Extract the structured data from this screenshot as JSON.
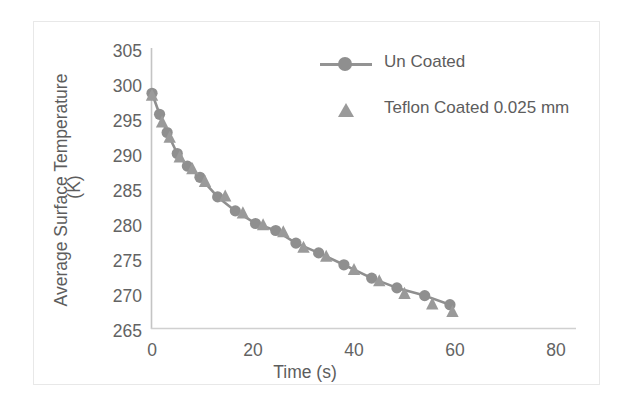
{
  "chart_data": {
    "type": "line",
    "title": "",
    "xlabel": "Time (s)",
    "ylabel": "Average Surface Temperature (K)",
    "ylabel_line1": "Average Surface Temperature",
    "ylabel_line2": "(K)",
    "xlim": [
      0,
      80
    ],
    "ylim": [
      265,
      305
    ],
    "xticks": [
      0,
      20,
      40,
      60,
      80
    ],
    "yticks": [
      265,
      270,
      275,
      280,
      285,
      290,
      295,
      300,
      305
    ],
    "grid": false,
    "legend_position": "top-right",
    "series_color": "#8f8f8f",
    "axis_color": "#c9c9c9",
    "text_color": "#5d5d5d",
    "series": [
      {
        "name": "Un Coated",
        "marker": "circle",
        "line": true,
        "x": [
          0,
          1.5,
          3,
          5,
          7,
          9.5,
          13,
          16.5,
          20.5,
          24.5,
          28.5,
          33,
          38,
          43.5,
          48.5,
          54,
          59
        ],
        "y": [
          298.6,
          295.6,
          293.0,
          290.0,
          288.2,
          286.6,
          283.8,
          281.8,
          280.0,
          279.0,
          277.2,
          275.8,
          274.1,
          272.2,
          270.8,
          269.7,
          268.4
        ]
      },
      {
        "name": "Teflon Coated 0.025 mm",
        "marker": "triangle",
        "line": false,
        "x": [
          0,
          2,
          3.5,
          5.5,
          8,
          10.5,
          14.5,
          18,
          22,
          26,
          30,
          34.5,
          40,
          45,
          50,
          55.5,
          59.5
        ],
        "y": [
          298.3,
          294.5,
          292.3,
          289.5,
          287.8,
          286.0,
          283.9,
          281.5,
          279.8,
          278.8,
          276.6,
          275.3,
          273.4,
          271.8,
          270.0,
          268.5,
          267.4
        ]
      }
    ]
  },
  "legend": {
    "items": [
      {
        "label": "Un Coated",
        "marker": "circle-line"
      },
      {
        "label": "Teflon Coated 0.025 mm",
        "marker": "triangle"
      }
    ]
  },
  "axes": {
    "y_tick_labels": [
      "305",
      "300",
      "295",
      "290",
      "285",
      "280",
      "275",
      "270",
      "265"
    ],
    "x_tick_labels": [
      "0",
      "20",
      "40",
      "60",
      "80"
    ],
    "x_title": "Time (s)",
    "y_title_line1": "Average Surface Temperature",
    "y_title_line2": "(K)"
  }
}
